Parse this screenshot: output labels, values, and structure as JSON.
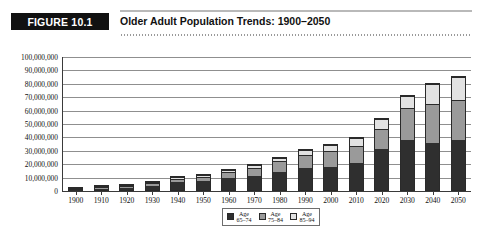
{
  "figure": {
    "tag": "FIGURE 10.1",
    "title": "Older Adult Population Trends: 1900–2050"
  },
  "chart_data": {
    "type": "bar",
    "stacked": true,
    "title": "Older Adult Population Trends: 1900–2050",
    "xlabel": "",
    "ylabel": "",
    "ylim": [
      0,
      100000000
    ],
    "ytick_step": 10000000,
    "grid": true,
    "legend_position": "bottom-center",
    "categories": [
      "1900",
      "1910",
      "1920",
      "1930",
      "1940",
      "1950",
      "1960",
      "1970",
      "1980",
      "1990",
      "2000",
      "2010",
      "2020",
      "2030",
      "2040",
      "2050"
    ],
    "ytick_labels": [
      "100,000,000",
      "90,000,000",
      "80,000,000",
      "70,000,000",
      "60,000,000",
      "50,000,000",
      "40,000,000",
      "30,000,000",
      "20,000,000",
      "10,000,000",
      "0"
    ],
    "series": [
      {
        "name": "Age 65–74",
        "color": "#2f2f2f",
        "values": [
          2200000,
          3000000,
          3900000,
          5400000,
          8000000,
          8400000,
          11000000,
          12500000,
          15600000,
          18100000,
          18400000,
          21700000,
          32300000,
          38800000,
          36100000,
          38800000
        ]
      },
      {
        "name": "Age 75–84",
        "color": "#9a9a9a",
        "values": [
          800000,
          1100000,
          1400000,
          1900000,
          2600000,
          3300000,
          4600000,
          6100000,
          7700000,
          10100000,
          12400000,
          13100000,
          15400000,
          24400000,
          30000000,
          30000000
        ]
      },
      {
        "name": "Age 85–94",
        "color": "#e2e2e2",
        "values": [
          100000,
          200000,
          300000,
          400000,
          600000,
          900000,
          1000000,
          1500000,
          2300000,
          3000000,
          4300000,
          5800000,
          6700000,
          8700000,
          14300000,
          17400000
        ]
      }
    ],
    "legend": [
      {
        "label_line1": "Age",
        "label_line2": "65–74",
        "color": "#2f2f2f"
      },
      {
        "label_line1": "Age",
        "label_line2": "75–84",
        "color": "#9a9a9a"
      },
      {
        "label_line1": "Age",
        "label_line2": "85–94",
        "color": "#e2e2e2"
      }
    ]
  }
}
